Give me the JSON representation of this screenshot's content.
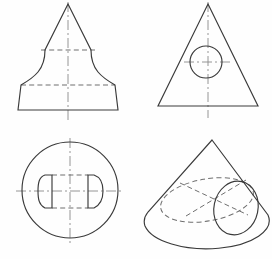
{
  "drawing": {
    "title": "Orthographic projection exercise sheet",
    "background_color": "#fefefe",
    "line_colors": {
      "visible_edge": "#3a3a3a",
      "hidden_edge": "#6f6f6f",
      "center_line": "#8a8a8a"
    },
    "panel_count": 4,
    "panels": [
      {
        "id": "top-left",
        "name": "bell-front-view",
        "description": "Front view of a bell / flared conical solid with stepped profile",
        "label": "",
        "apex": {
          "x": 68,
          "y": 4
        },
        "base": {
          "left_x": 18,
          "right_x": 118,
          "y": 110
        },
        "center_line": {
          "x": 68,
          "y_top": 2,
          "y_bottom": 122
        },
        "hidden_lines": [
          {
            "name": "upper-step",
            "x1": 41,
            "y1": 50,
            "x2": 95,
            "y2": 50
          },
          {
            "name": "lower-step",
            "x1": 21,
            "y1": 85,
            "x2": 115,
            "y2": 85
          }
        ],
        "profile": "flared-bell"
      },
      {
        "id": "top-right",
        "name": "triangle-with-circle-view",
        "description": "Triangular front view containing a visible circle (through hole)",
        "label": "",
        "apex": {
          "x": 208,
          "y": 4
        },
        "base": {
          "left_x": 158,
          "right_x": 258,
          "y": 106
        },
        "circle": {
          "cx": 206,
          "cy": 62,
          "r": 16
        },
        "center_lines": [
          {
            "name": "vertical",
            "x1": 208,
            "y1": 2,
            "x2": 208,
            "y2": 118
          },
          {
            "name": "horizontal",
            "x1": 184,
            "y1": 62,
            "x2": 230,
            "y2": 62
          }
        ]
      },
      {
        "id": "bottom-left",
        "name": "circle-plan-view",
        "description": "Circular plan view with two opposed D-shaped features and hidden slot lines",
        "label": "",
        "circle": {
          "cx": 70,
          "cy": 190,
          "r": 48
        },
        "center_lines": [
          {
            "name": "vertical",
            "x1": 70,
            "y1": 138,
            "x2": 70,
            "y2": 243
          },
          {
            "name": "horizontal",
            "x1": 16,
            "y1": 191,
            "x2": 124,
            "y2": 191
          }
        ],
        "d_features": [
          {
            "name": "left-d-shape",
            "flat_x": 52,
            "bulge_x": 38,
            "y_top": 175,
            "y_bottom": 208
          },
          {
            "name": "right-d-shape",
            "flat_x": 88,
            "bulge_x": 103,
            "y_top": 175,
            "y_bottom": 208
          }
        ],
        "hidden_lines": [
          {
            "name": "slot-top",
            "x1": 52,
            "y1": 175,
            "x2": 88,
            "y2": 175
          },
          {
            "name": "slot-bottom",
            "x1": 52,
            "y1": 208,
            "x2": 88,
            "y2": 208
          }
        ]
      },
      {
        "id": "bottom-right",
        "name": "cone-pictorial-view",
        "description": "Isometric pictorial of a cone with an elliptical hole and hidden construction ellipse",
        "label": "",
        "apex": {
          "x": 212,
          "y": 140
        },
        "base_ellipse": {
          "cx": 207,
          "cy": 226,
          "rx": 62,
          "ry": 28
        },
        "hidden_ellipse": {
          "cx": 207,
          "cy": 200,
          "rx": 47,
          "ry": 21,
          "rotation": -10
        },
        "hole_ellipse": {
          "cx": 236,
          "cy": 208,
          "rx": 22,
          "ry": 27,
          "rotation": 12
        },
        "hidden_lines": [
          {
            "name": "cut-line-left",
            "x1": 180,
            "y1": 183,
            "x2": 248,
            "y2": 215
          },
          {
            "name": "cut-line-right",
            "x1": 186,
            "y1": 216,
            "x2": 246,
            "y2": 180
          }
        ]
      }
    ]
  }
}
